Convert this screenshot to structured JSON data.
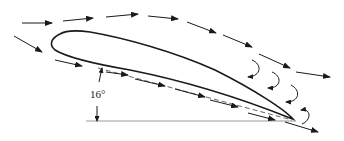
{
  "diagram": {
    "title": "",
    "angle_of_attack_label": "16°",
    "elements": [
      {
        "type": "airfoil",
        "description": "cambered airfoil outline, leading edge left, trailing edge lower right"
      },
      {
        "type": "chord-line",
        "style": "dashed",
        "description": "chord line from leading edge to trailing edge"
      },
      {
        "type": "reference-line",
        "style": "solid",
        "description": "horizontal reference line"
      },
      {
        "type": "angle-marker",
        "label": "16°",
        "description": "double-headed arrow between chord line and horizontal"
      },
      {
        "type": "streamlines-upper",
        "style": "dashed arrows",
        "description": "flow over upper surface, separating from the top"
      },
      {
        "type": "streamlines-lower",
        "style": "dashed arrows",
        "description": "flow along the lower surface following the chord"
      },
      {
        "type": "wake-vortices",
        "style": "curved arrows",
        "description": "recirculating eddies above the trailing portion of the airfoil"
      }
    ],
    "colors": {
      "stroke": "#1a1a1a",
      "reference_line": "#999999",
      "background": "#ffffff"
    }
  }
}
